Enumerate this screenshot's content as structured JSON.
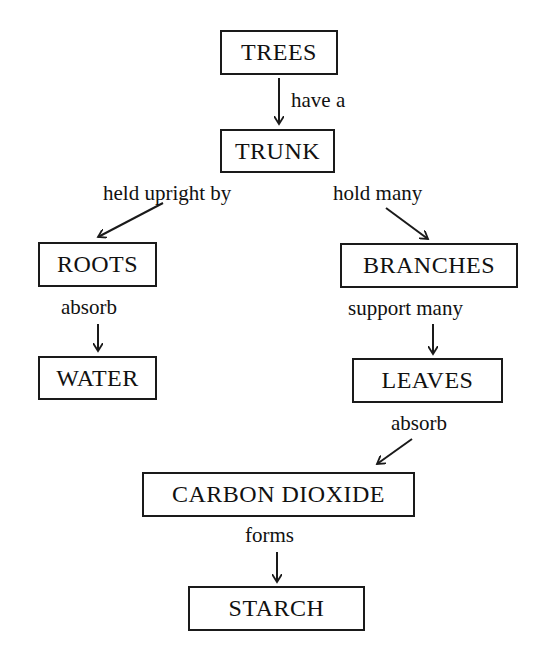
{
  "nodes": {
    "trees": "TREES",
    "trunk": "TRUNK",
    "roots": "ROOTS",
    "branches": "BRANCHES",
    "water": "WATER",
    "leaves": "LEAVES",
    "carbon_dioxide": "CARBON DIOXIDE",
    "starch": "STARCH"
  },
  "edges": {
    "trees_trunk": "have a",
    "trunk_roots": "held upright by",
    "trunk_branches": "hold many",
    "roots_water": "absorb",
    "branches_leaves": "support many",
    "leaves_co2": "absorb",
    "co2_starch": "forms"
  }
}
